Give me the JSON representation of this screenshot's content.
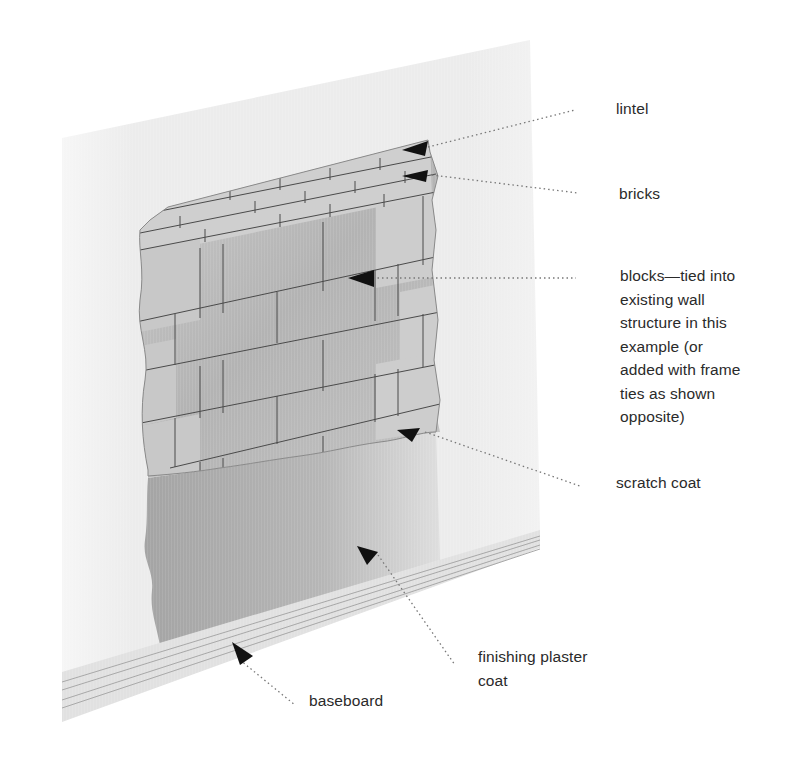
{
  "diagram": {
    "colors": {
      "wall_face": "#eeeeee",
      "block": "#b9b9b9",
      "brick": "#cfcfcf",
      "scratch_coat": "#c4c4c4",
      "finishing_plaster": "#a8a8a8",
      "baseboard": "#e2e2e2",
      "arrow": "#111111",
      "leader_line": "#777777",
      "label_text": "#2a2a2a"
    }
  },
  "labels": {
    "lintel": "lintel",
    "bricks": "bricks",
    "blocks": "blocks—tied into\nexisting wall\nstructure in this\nexample (or\nadded with frame\nties as shown\nopposite)",
    "scratch_coat": "scratch coat",
    "finishing_plaster": "finishing plaster\ncoat",
    "baseboard": "baseboard"
  }
}
